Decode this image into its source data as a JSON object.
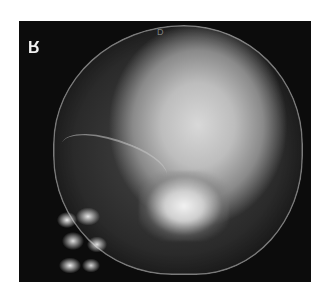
{
  "image": {
    "subject": "Lateral skull radiograph",
    "side_marker": "R",
    "overprint_text": "D"
  },
  "colors": {
    "background": "#ffffff",
    "film": "#0c0c0c",
    "bone_bright": "#f2f2f2"
  }
}
